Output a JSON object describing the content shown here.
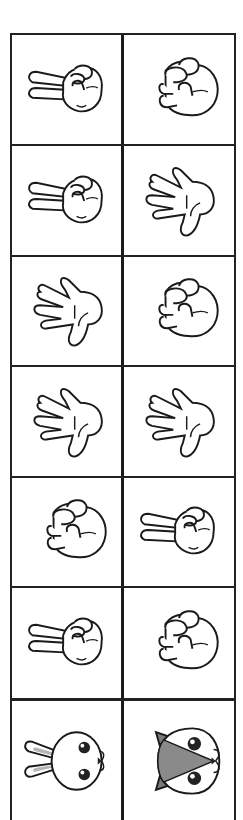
{
  "worksheet": {
    "title": "Rock Paper Scissors",
    "line_color": "#222222",
    "rows": [
      {
        "left": {
          "gesture": "scissors",
          "label": "scissors-hand-icon"
        },
        "right": {
          "gesture": "rock",
          "label": "rock-fist-icon"
        }
      },
      {
        "left": {
          "gesture": "scissors",
          "label": "scissors-hand-icon"
        },
        "right": {
          "gesture": "paper",
          "label": "paper-hand-icon"
        }
      },
      {
        "left": {
          "gesture": "paper",
          "label": "paper-hand-icon"
        },
        "right": {
          "gesture": "rock",
          "label": "rock-fist-icon"
        }
      },
      {
        "left": {
          "gesture": "paper",
          "label": "paper-hand-icon"
        },
        "right": {
          "gesture": "paper",
          "label": "paper-hand-icon"
        }
      },
      {
        "left": {
          "gesture": "rock",
          "label": "rock-fist-icon"
        },
        "right": {
          "gesture": "scissors",
          "label": "scissors-hand-icon"
        }
      },
      {
        "left": {
          "gesture": "scissors",
          "label": "scissors-hand-icon"
        },
        "right": {
          "gesture": "rock",
          "label": "rock-fist-icon"
        }
      },
      {
        "left": {
          "gesture": "rabbit",
          "label": "rabbit-face-icon"
        },
        "right": {
          "gesture": "cat",
          "label": "cat-face-icon"
        }
      }
    ],
    "colors": {
      "stroke": "#1a1a1a",
      "fill": "#ffffff",
      "ear_inner": "#b5b5b5",
      "cat_patch": "#8a8a8a",
      "cat_ear": "#7a7a7a"
    }
  }
}
